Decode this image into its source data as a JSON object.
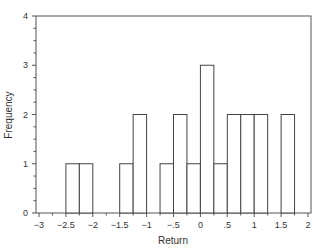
{
  "chart_data": {
    "type": "bar",
    "subtype": "histogram",
    "title": "",
    "xlabel": "Return",
    "ylabel": "Frequency",
    "xlim": [
      -3,
      2
    ],
    "ylim": [
      0,
      4
    ],
    "bin_width": 0.25,
    "x_ticks": [
      -3,
      -2.5,
      -2,
      -1.5,
      -1,
      -0.5,
      0,
      0.5,
      1,
      1.5,
      2
    ],
    "x_tick_labels": [
      "−3",
      "−2.5",
      "−2",
      "−1.5",
      "−1",
      "−.5",
      "0",
      ".5",
      "1",
      "1.5",
      "2"
    ],
    "y_ticks": [
      0,
      1,
      2,
      3,
      4
    ],
    "y_tick_labels": [
      "0",
      "1",
      "2",
      "3",
      "4"
    ],
    "grid": false,
    "legend": null,
    "bins": [
      {
        "start": -2.5,
        "end": -2.25,
        "count": 1
      },
      {
        "start": -2.25,
        "end": -2.0,
        "count": 1
      },
      {
        "start": -1.5,
        "end": -1.25,
        "count": 1
      },
      {
        "start": -1.25,
        "end": -1.0,
        "count": 2
      },
      {
        "start": -0.75,
        "end": -0.5,
        "count": 1
      },
      {
        "start": -0.5,
        "end": -0.25,
        "count": 2
      },
      {
        "start": -0.25,
        "end": 0.0,
        "count": 1
      },
      {
        "start": 0.0,
        "end": 0.25,
        "count": 3
      },
      {
        "start": 0.25,
        "end": 0.5,
        "count": 1
      },
      {
        "start": 0.5,
        "end": 0.75,
        "count": 2
      },
      {
        "start": 0.75,
        "end": 1.0,
        "count": 2
      },
      {
        "start": 1.0,
        "end": 1.25,
        "count": 2
      },
      {
        "start": 1.5,
        "end": 1.75,
        "count": 2
      }
    ],
    "colors": {
      "bar_fill": "#ffffff",
      "bar_stroke": "#444444",
      "axis": "#555555"
    }
  }
}
